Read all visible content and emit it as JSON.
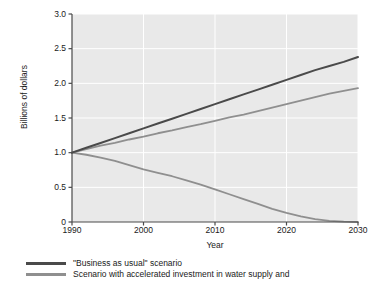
{
  "chart_data": {
    "type": "line",
    "title": "",
    "xlabel": "Year",
    "ylabel": "Billions of dollars",
    "xlim": [
      1990,
      2030
    ],
    "ylim": [
      0,
      3.0
    ],
    "xticks": [
      "1990",
      "2000",
      "2010",
      "2020",
      "2030"
    ],
    "xtick_values": [
      1990,
      2000,
      2010,
      2020,
      2030
    ],
    "yticks": [
      "0",
      "0.5",
      "1.0",
      "1.5",
      "2.0",
      "2.5",
      "3.0"
    ],
    "ytick_values": [
      0,
      0.5,
      1.0,
      1.5,
      2.0,
      2.5,
      3.0
    ],
    "grid": true,
    "grid_color": "#ffffff",
    "plot_background": "#e9e9e9",
    "legend_position": "below",
    "x": [
      1990,
      1992,
      1994,
      1996,
      1998,
      2000,
      2002,
      2004,
      2006,
      2008,
      2010,
      2012,
      2014,
      2016,
      2018,
      2020,
      2022,
      2024,
      2026,
      2028,
      2030
    ],
    "series": [
      {
        "name": "\"Business as usual\" scenario",
        "color": "#4a4a4a",
        "width": 2.0,
        "values": [
          1.0,
          1.07,
          1.14,
          1.21,
          1.28,
          1.35,
          1.42,
          1.49,
          1.56,
          1.63,
          1.7,
          1.77,
          1.84,
          1.91,
          1.98,
          2.05,
          2.12,
          2.19,
          2.25,
          2.31,
          2.38
        ]
      },
      {
        "name": "Scenario with accelerated investment in water supply and",
        "color": "#8f8f8f",
        "width": 1.8,
        "values": [
          1.0,
          1.05,
          1.1,
          1.14,
          1.19,
          1.23,
          1.28,
          1.32,
          1.37,
          1.41,
          1.46,
          1.51,
          1.55,
          1.6,
          1.65,
          1.7,
          1.75,
          1.8,
          1.85,
          1.89,
          1.93
        ]
      },
      {
        "name": "declining-scenario",
        "color": "#8f8f8f",
        "width": 1.8,
        "values": [
          1.0,
          0.97,
          0.93,
          0.88,
          0.82,
          0.76,
          0.71,
          0.66,
          0.6,
          0.54,
          0.47,
          0.4,
          0.33,
          0.26,
          0.19,
          0.13,
          0.08,
          0.04,
          0.015,
          0.005,
          0.0
        ]
      }
    ]
  },
  "legend": {
    "items": [
      {
        "label": "\"Business as usual\" scenario",
        "color": "#4a4a4a"
      },
      {
        "label": "Scenario with accelerated investment in water supply and",
        "color": "#8f8f8f"
      }
    ]
  }
}
